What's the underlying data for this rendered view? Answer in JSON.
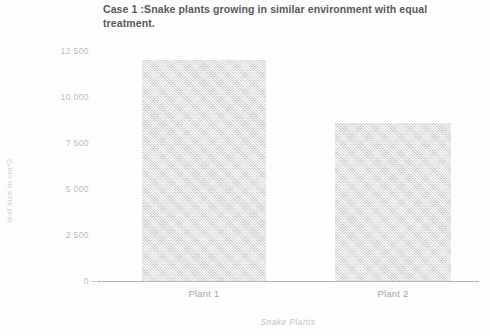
{
  "chart_data": {
    "type": "bar",
    "title": "Case 1 :Snake plants growing in similar environment with equal treatment.",
    "xlabel": "Snake Plants",
    "ylabel": "leaf size in cm^2",
    "categories": [
      "Plant 1",
      "Plant 2"
    ],
    "values": [
      12000,
      8600
    ],
    "ylim": [
      0,
      12500
    ],
    "yticks": [
      0,
      2500,
      5000,
      7500,
      10000,
      12500
    ],
    "ytick_labels": [
      "0",
      "2 500",
      "5 000",
      "7 500",
      "10 000",
      "12 500"
    ],
    "grid": false,
    "legend": null,
    "bar_color": "#d9d9d9",
    "axis_color": "#b6b6b6",
    "text_color": "#5a5a5a"
  }
}
